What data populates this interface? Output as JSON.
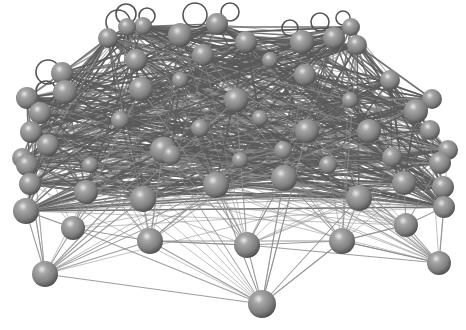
{
  "figure": {
    "type": "3d-network-graph",
    "background": "#ffffff",
    "node_color": "#8a8a8a",
    "node_highlight": "#e6e6e6",
    "node_shadow": "#4a4a4a",
    "edge_color": "#5a5a5a",
    "edge_color_light": "#8c8c8c"
  },
  "nodes": [
    {
      "id": 0,
      "x": 108,
      "y": 38,
      "r": 10
    },
    {
      "id": 1,
      "x": 127,
      "y": 27,
      "r": 9
    },
    {
      "id": 2,
      "x": 143,
      "y": 26,
      "r": 9
    },
    {
      "id": 3,
      "x": 180,
      "y": 35,
      "r": 12
    },
    {
      "id": 4,
      "x": 217,
      "y": 24,
      "r": 11
    },
    {
      "id": 5,
      "x": 203,
      "y": 55,
      "r": 11
    },
    {
      "id": 6,
      "x": 246,
      "y": 42,
      "r": 11
    },
    {
      "id": 7,
      "x": 302,
      "y": 42,
      "r": 12
    },
    {
      "id": 8,
      "x": 334,
      "y": 38,
      "r": 11
    },
    {
      "id": 9,
      "x": 351,
      "y": 27,
      "r": 9
    },
    {
      "id": 10,
      "x": 357,
      "y": 45,
      "r": 10
    },
    {
      "id": 11,
      "x": 136,
      "y": 60,
      "r": 11
    },
    {
      "id": 12,
      "x": 305,
      "y": 75,
      "r": 11
    },
    {
      "id": 13,
      "x": 390,
      "y": 80,
      "r": 10
    },
    {
      "id": 14,
      "x": 62,
      "y": 73,
      "r": 11
    },
    {
      "id": 15,
      "x": 65,
      "y": 92,
      "r": 12
    },
    {
      "id": 16,
      "x": 27,
      "y": 98,
      "r": 11
    },
    {
      "id": 17,
      "x": 141,
      "y": 89,
      "r": 12
    },
    {
      "id": 18,
      "x": 236,
      "y": 100,
      "r": 12
    },
    {
      "id": 19,
      "x": 432,
      "y": 99,
      "r": 10
    },
    {
      "id": 20,
      "x": 416,
      "y": 111,
      "r": 12
    },
    {
      "id": 21,
      "x": 40,
      "y": 113,
      "r": 11
    },
    {
      "id": 22,
      "x": 31,
      "y": 132,
      "r": 11
    },
    {
      "id": 23,
      "x": 48,
      "y": 145,
      "r": 11
    },
    {
      "id": 24,
      "x": 307,
      "y": 131,
      "r": 12
    },
    {
      "id": 25,
      "x": 369,
      "y": 131,
      "r": 12
    },
    {
      "id": 26,
      "x": 430,
      "y": 130,
      "r": 10
    },
    {
      "id": 27,
      "x": 163,
      "y": 150,
      "r": 13
    },
    {
      "id": 28,
      "x": 27,
      "y": 165,
      "r": 11
    },
    {
      "id": 29,
      "x": 22,
      "y": 158,
      "r": 10
    },
    {
      "id": 30,
      "x": 448,
      "y": 150,
      "r": 10
    },
    {
      "id": 31,
      "x": 392,
      "y": 157,
      "r": 10
    },
    {
      "id": 32,
      "x": 440,
      "y": 163,
      "r": 11
    },
    {
      "id": 33,
      "x": 30,
      "y": 184,
      "r": 11
    },
    {
      "id": 34,
      "x": 86,
      "y": 192,
      "r": 12
    },
    {
      "id": 35,
      "x": 143,
      "y": 199,
      "r": 13
    },
    {
      "id": 36,
      "x": 216,
      "y": 185,
      "r": 13
    },
    {
      "id": 37,
      "x": 284,
      "y": 178,
      "r": 13
    },
    {
      "id": 38,
      "x": 404,
      "y": 183,
      "r": 12
    },
    {
      "id": 39,
      "x": 359,
      "y": 198,
      "r": 13
    },
    {
      "id": 40,
      "x": 443,
      "y": 187,
      "r": 11
    },
    {
      "id": 41,
      "x": 444,
      "y": 207,
      "r": 11
    },
    {
      "id": 42,
      "x": 26,
      "y": 211,
      "r": 13
    },
    {
      "id": 43,
      "x": 406,
      "y": 225,
      "r": 12
    },
    {
      "id": 44,
      "x": 73,
      "y": 228,
      "r": 12
    },
    {
      "id": 45,
      "x": 150,
      "y": 241,
      "r": 13
    },
    {
      "id": 46,
      "x": 247,
      "y": 245,
      "r": 13
    },
    {
      "id": 47,
      "x": 342,
      "y": 241,
      "r": 13
    },
    {
      "id": 48,
      "x": 439,
      "y": 263,
      "r": 12
    },
    {
      "id": 49,
      "x": 45,
      "y": 274,
      "r": 13
    },
    {
      "id": 50,
      "x": 262,
      "y": 304,
      "r": 14
    },
    {
      "id": 51,
      "x": 171,
      "y": 155,
      "r": 10
    },
    {
      "id": 52,
      "x": 283,
      "y": 150,
      "r": 9
    },
    {
      "id": 53,
      "x": 328,
      "y": 165,
      "r": 9
    },
    {
      "id": 54,
      "x": 120,
      "y": 120,
      "r": 9
    },
    {
      "id": 55,
      "x": 200,
      "y": 128,
      "r": 9
    },
    {
      "id": 56,
      "x": 260,
      "y": 118,
      "r": 8
    },
    {
      "id": 57,
      "x": 350,
      "y": 100,
      "r": 8
    },
    {
      "id": 58,
      "x": 90,
      "y": 165,
      "r": 8
    },
    {
      "id": 59,
      "x": 240,
      "y": 160,
      "r": 8
    },
    {
      "id": 60,
      "x": 180,
      "y": 80,
      "r": 8
    },
    {
      "id": 61,
      "x": 270,
      "y": 60,
      "r": 8
    }
  ],
  "loops": [
    {
      "node": 0,
      "cx": 118,
      "cy": 22,
      "r": 12
    },
    {
      "node": 1,
      "cx": 126,
      "cy": 14,
      "r": 10
    },
    {
      "node": 3,
      "cx": 195,
      "cy": 15,
      "r": 12
    },
    {
      "node": 4,
      "cx": 230,
      "cy": 12,
      "r": 9
    },
    {
      "node": 8,
      "cx": 320,
      "cy": 22,
      "r": 9
    },
    {
      "node": 14,
      "cx": 48,
      "cy": 72,
      "r": 12
    },
    {
      "node": 15,
      "cx": 46,
      "cy": 91,
      "r": 10
    },
    {
      "node": 2,
      "cx": 147,
      "cy": 16,
      "r": 8
    },
    {
      "node": 7,
      "cx": 290,
      "cy": 28,
      "r": 8
    },
    {
      "node": 9,
      "cx": 343,
      "cy": 18,
      "r": 7
    }
  ],
  "edge_seed": 7,
  "edge_count": 900,
  "bottom_edges": [
    [
      49,
      42
    ],
    [
      49,
      44
    ],
    [
      49,
      45
    ],
    [
      49,
      35
    ],
    [
      49,
      27
    ],
    [
      49,
      18
    ],
    [
      44,
      42
    ],
    [
      44,
      34
    ],
    [
      44,
      17
    ],
    [
      45,
      35
    ],
    [
      45,
      27
    ],
    [
      45,
      36
    ],
    [
      45,
      46
    ],
    [
      46,
      37
    ],
    [
      46,
      36
    ],
    [
      46,
      50
    ],
    [
      46,
      27
    ],
    [
      46,
      17
    ],
    [
      46,
      18
    ],
    [
      46,
      45
    ],
    [
      50,
      47
    ],
    [
      50,
      45
    ],
    [
      50,
      36
    ],
    [
      50,
      37
    ],
    [
      50,
      39
    ],
    [
      50,
      44
    ],
    [
      50,
      49
    ],
    [
      50,
      24
    ],
    [
      47,
      39
    ],
    [
      47,
      48
    ],
    [
      47,
      43
    ],
    [
      47,
      37
    ],
    [
      47,
      45
    ],
    [
      48,
      43
    ],
    [
      48,
      41
    ],
    [
      48,
      39
    ],
    [
      48,
      37
    ],
    [
      48,
      24
    ],
    [
      48,
      46
    ],
    [
      42,
      33
    ],
    [
      42,
      35
    ],
    [
      42,
      27
    ],
    [
      43,
      41
    ],
    [
      43,
      38
    ],
    [
      43,
      39
    ],
    [
      41,
      40
    ],
    [
      41,
      38
    ],
    [
      33,
      34
    ],
    [
      33,
      28
    ],
    [
      35,
      34
    ],
    [
      36,
      37
    ],
    [
      39,
      38
    ],
    [
      44,
      45
    ],
    [
      49,
      33
    ],
    [
      47,
      46
    ],
    [
      48,
      47
    ],
    [
      43,
      47
    ]
  ]
}
